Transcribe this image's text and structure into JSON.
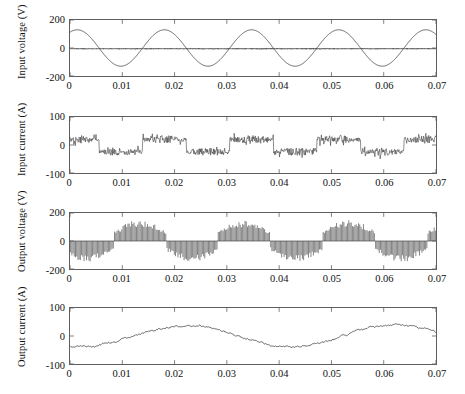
{
  "figure": {
    "kind": "stacked-timeseries",
    "panel_count": 4,
    "background": "#ffffff",
    "trace_color": "#3d3d3d",
    "axis_color": "#5e5e5e"
  },
  "chart_data": [
    {
      "type": "line",
      "title": "",
      "xlabel": "",
      "ylabel": "Input voltage (V)",
      "xlim": [
        0,
        0.07
      ],
      "ylim": [
        -200,
        200
      ],
      "xticks": [
        0,
        0.01,
        0.02,
        0.03,
        0.04,
        0.05,
        0.06,
        0.07
      ],
      "xticklabels": [
        "0",
        "0.01",
        "0.02",
        "0.03",
        "0.04",
        "0.05",
        "0.06",
        "0.07"
      ],
      "yticks": [
        -200,
        0,
        200
      ],
      "yticklabels": [
        "-200",
        "0",
        "200"
      ],
      "grid": false,
      "legend": "none",
      "series": [
        {
          "name": "supply voltage",
          "shape": "sine",
          "amplitude": 130,
          "frequency_hz": 60,
          "phase_deg": 60,
          "offset": 0
        },
        {
          "name": "switching ripple band",
          "shape": "noise-band",
          "center": -5,
          "band": 11,
          "density": 420
        }
      ]
    },
    {
      "type": "line",
      "title": "",
      "xlabel": "",
      "ylabel": "Input current (A)",
      "xlim": [
        0,
        0.07
      ],
      "ylim": [
        -100,
        100
      ],
      "xticks": [
        0,
        0.01,
        0.02,
        0.03,
        0.04,
        0.05,
        0.06,
        0.07
      ],
      "xticklabels": [
        "0",
        "0.01",
        "0.02",
        "0.03",
        "0.04",
        "0.05",
        "0.06",
        "0.07"
      ],
      "yticks": [
        -100,
        0,
        100
      ],
      "yticklabels": [
        "-100",
        "0",
        "100"
      ],
      "grid": false,
      "legend": "none",
      "series": [
        {
          "name": "input current",
          "shape": "chopped-square-noise",
          "envelope_amplitude": 34,
          "envelope_frequency_hz": 60,
          "envelope_phase_deg": 60,
          "spike_spread": 18,
          "samples": 760
        }
      ]
    },
    {
      "type": "line",
      "title": "",
      "xlabel": "",
      "ylabel": "Output voltage (V)",
      "xlim": [
        0,
        0.07
      ],
      "ylim": [
        -200,
        200
      ],
      "xticks": [
        0,
        0.01,
        0.02,
        0.03,
        0.04,
        0.05,
        0.06,
        0.07
      ],
      "xticklabels": [
        "0",
        "0.01",
        "0.02",
        "0.03",
        "0.04",
        "0.05",
        "0.06",
        "0.07"
      ],
      "yticks": [
        -200,
        0,
        200
      ],
      "yticklabels": [
        "-200",
        "0",
        "200"
      ],
      "grid": false,
      "legend": "none",
      "series": [
        {
          "name": "pwm output voltage",
          "shape": "pwm-pulse-train",
          "envelope_amplitude": 150,
          "envelope_frequency_hz": 50,
          "envelope_phase_deg": -150,
          "pulse_count": 300,
          "baseline": 0
        }
      ]
    },
    {
      "type": "line",
      "title": "",
      "xlabel": "",
      "ylabel": "Output current (A)",
      "xlim": [
        0,
        0.07
      ],
      "ylim": [
        -100,
        100
      ],
      "xticks": [
        0,
        0.01,
        0.02,
        0.03,
        0.04,
        0.05,
        0.06,
        0.07
      ],
      "xticklabels": [
        "0",
        "0.01",
        "0.02",
        "0.03",
        "0.04",
        "0.05",
        "0.06",
        "0.07"
      ],
      "yticks": [
        -100,
        0,
        100
      ],
      "yticklabels": [
        "-100",
        "0",
        "100"
      ],
      "grid": false,
      "legend": "none",
      "series": [
        {
          "name": "output current",
          "shape": "smooth-sine-with-ripple",
          "amplitude": 38,
          "frequency_hz": 25,
          "phase_deg": -110,
          "ripple": 5,
          "samples": 520
        }
      ]
    }
  ],
  "panels": [
    {
      "id": "input-voltage",
      "ylabel": "Input voltage (V)",
      "top": 19,
      "height": 58
    },
    {
      "id": "input-current",
      "ylabel": "Input current (A)",
      "top": 116,
      "height": 58
    },
    {
      "id": "output-voltage",
      "ylabel": "Output voltage (V)",
      "top": 212,
      "height": 58
    },
    {
      "id": "output-current",
      "ylabel": "Output current (A)",
      "top": 307,
      "height": 58
    }
  ],
  "geometry": {
    "plot_left": 69,
    "plot_right": 437
  }
}
